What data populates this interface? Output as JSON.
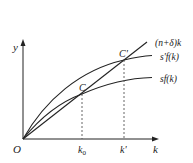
{
  "diagram": {
    "axes": {
      "x_label": "k",
      "y_label": "y",
      "origin_label": "O"
    },
    "curves": [
      {
        "id": "break-even",
        "label": "(n+δ)k",
        "type": "line"
      },
      {
        "id": "saving-new",
        "label": "s'f(k)",
        "type": "concave"
      },
      {
        "id": "saving-old",
        "label": "sf(k)",
        "type": "concave"
      }
    ],
    "points": [
      {
        "id": "C",
        "label": "C"
      },
      {
        "id": "C-prime",
        "label": "C'"
      }
    ],
    "x_ticks": [
      {
        "id": "k0",
        "label": "k",
        "subscript": "0"
      },
      {
        "id": "k-prime",
        "label": "k'"
      }
    ],
    "colors": {
      "line": "#222222",
      "dashed": "#555555",
      "background": "#ffffff"
    }
  }
}
